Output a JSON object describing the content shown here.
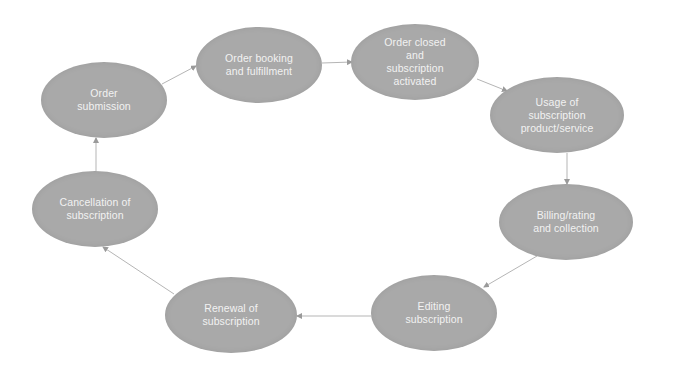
{
  "diagram": {
    "type": "cycle",
    "colors": {
      "node_fill": "#a9a9a9",
      "node_text": "#f2f2f2",
      "edge": "#b5b5b5",
      "background": "#ffffff"
    },
    "nodes": [
      {
        "id": "order-submission",
        "label": "Order\nsubmission",
        "cx": 104,
        "cy": 100,
        "rx": 63,
        "ry": 38
      },
      {
        "id": "order-booking",
        "label": "Order booking\nand fulfillment",
        "cx": 259,
        "cy": 65,
        "rx": 63,
        "ry": 38
      },
      {
        "id": "order-closed",
        "label": "Order closed\nand\nsubscription\nactivated",
        "cx": 415,
        "cy": 62,
        "rx": 64,
        "ry": 38
      },
      {
        "id": "usage",
        "label": "Usage of\nsubscription\nproduct/service",
        "cx": 557,
        "cy": 115,
        "rx": 67,
        "ry": 38
      },
      {
        "id": "billing",
        "label": "Billing/rating\nand collection",
        "cx": 566,
        "cy": 222,
        "rx": 67,
        "ry": 38
      },
      {
        "id": "editing",
        "label": "Editing\nsubscription",
        "cx": 434,
        "cy": 313,
        "rx": 63,
        "ry": 38
      },
      {
        "id": "renewal",
        "label": "Renewal of\nsubscription",
        "cx": 231,
        "cy": 315,
        "rx": 66,
        "ry": 38
      },
      {
        "id": "cancellation",
        "label": "Cancellation of\nsubscription",
        "cx": 95,
        "cy": 209,
        "rx": 63,
        "ry": 38
      }
    ],
    "edges": [
      {
        "from": "order-submission",
        "to": "order-booking",
        "x1": 162,
        "y1": 84,
        "x2": 196,
        "y2": 66
      },
      {
        "from": "order-booking",
        "to": "order-closed",
        "x1": 322,
        "y1": 63,
        "x2": 352,
        "y2": 62
      },
      {
        "from": "order-closed",
        "to": "usage",
        "x1": 477,
        "y1": 79,
        "x2": 507,
        "y2": 91
      },
      {
        "from": "usage",
        "to": "billing",
        "x1": 567,
        "y1": 153,
        "x2": 567,
        "y2": 184
      },
      {
        "from": "billing",
        "to": "editing",
        "x1": 537,
        "y1": 256,
        "x2": 484,
        "y2": 287
      },
      {
        "from": "editing",
        "to": "renewal",
        "x1": 371,
        "y1": 316,
        "x2": 297,
        "y2": 316
      },
      {
        "from": "renewal",
        "to": "cancellation",
        "x1": 174,
        "y1": 294,
        "x2": 103,
        "y2": 247
      },
      {
        "from": "cancellation",
        "to": "order-submission",
        "x1": 96,
        "y1": 171,
        "x2": 96,
        "y2": 138
      }
    ]
  }
}
